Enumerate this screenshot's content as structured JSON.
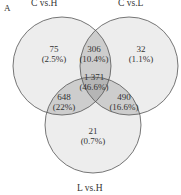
{
  "panel_label": "A",
  "sets": [
    {
      "name": "C vs.H",
      "cx": 62,
      "cy": 66,
      "r": 49
    },
    {
      "name": "C vs.L",
      "cx": 129,
      "cy": 66,
      "r": 49
    },
    {
      "name": "L vs.H",
      "cx": 93,
      "cy": 125,
      "r": 48
    }
  ],
  "colors": {
    "single": "#ededed",
    "pair": "#cdcdcd",
    "triple": "#b5b5b5",
    "stroke": "#555555"
  },
  "regions": {
    "c_h_only": {
      "count": "75",
      "pct": "(2.5%)"
    },
    "c_l_only": {
      "count": "32",
      "pct": "(1.1%)"
    },
    "l_h_only": {
      "count": "21",
      "pct": "(0.7%)"
    },
    "ch_cl": {
      "count": "306",
      "pct": "(10.4%)"
    },
    "ch_lh": {
      "count": "648",
      "pct": "(22%)"
    },
    "cl_lh": {
      "count": "490",
      "pct": "(16.6%)"
    },
    "all": {
      "count": "1 371",
      "pct": "(46.6%)"
    }
  }
}
